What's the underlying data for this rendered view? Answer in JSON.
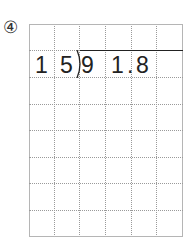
{
  "problem": {
    "number_label": "④",
    "divisor_digits": [
      "1",
      "5"
    ],
    "dividend_digits": [
      "9",
      "1",
      ".",
      "8"
    ],
    "expression": "91.8 ÷ 15"
  },
  "grid": {
    "columns": 6,
    "rows": 8,
    "line_color": "#9a9a9a"
  }
}
